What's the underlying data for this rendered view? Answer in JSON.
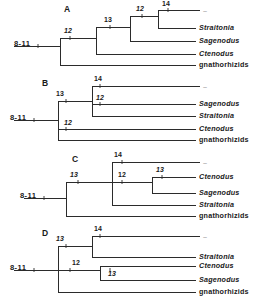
{
  "figure": {
    "background": "#ffffff",
    "line_color": "#2b2b2b"
  },
  "taxa": {
    "t1": "–",
    "straitonia": "Straitonia",
    "sagenodus": "Sagenodus",
    "ctenodus": "Ctenodus",
    "gnathorhizids": "gnathorhizids"
  },
  "root": {
    "label": "8-11"
  },
  "panels": [
    {
      "letter": "A",
      "root_label": "8-11",
      "nodes": [
        {
          "id": "a-n1",
          "label": "12"
        },
        {
          "id": "a-n2",
          "label": "13"
        },
        {
          "id": "a-n3",
          "label": "12"
        },
        {
          "id": "a-n4",
          "label": "14"
        }
      ],
      "tips": [
        {
          "id": "a-t1",
          "label": "–",
          "style": "faded"
        },
        {
          "id": "a-t2",
          "label": "Straitonia",
          "style": "italic"
        },
        {
          "id": "a-t3",
          "label": "Sagenodus",
          "style": "italic"
        },
        {
          "id": "a-t4",
          "label": "Ctenodus",
          "style": "italic"
        },
        {
          "id": "a-t5",
          "label": "gnathorhizids",
          "style": "upright"
        }
      ]
    },
    {
      "letter": "B",
      "root_label": "8-11",
      "nodes": [
        {
          "id": "b-n1",
          "label": "13"
        },
        {
          "id": "b-n2",
          "label": "14"
        },
        {
          "id": "b-n3",
          "label": "12"
        },
        {
          "id": "b-n4",
          "label": "12"
        }
      ],
      "tips": [
        {
          "id": "b-t1",
          "label": "–",
          "style": "faded"
        },
        {
          "id": "b-t2",
          "label": "Sagenodus",
          "style": "italic"
        },
        {
          "id": "b-t3",
          "label": "Straitonia",
          "style": "italic"
        },
        {
          "id": "b-t4",
          "label": "Ctenodus",
          "style": "italic"
        },
        {
          "id": "b-t5",
          "label": "gnathorhizids",
          "style": "upright"
        }
      ]
    },
    {
      "letter": "C",
      "root_label": "8-11",
      "nodes": [
        {
          "id": "c-n1",
          "label": "13"
        },
        {
          "id": "c-n2",
          "label": "14"
        },
        {
          "id": "c-n3",
          "label": "12"
        },
        {
          "id": "c-n4",
          "label": "13"
        }
      ],
      "tips": [
        {
          "id": "c-t1",
          "label": "–",
          "style": "faded"
        },
        {
          "id": "c-t2",
          "label": "Ctenodus",
          "style": "italic"
        },
        {
          "id": "c-t3",
          "label": "Sagenodus",
          "style": "italic"
        },
        {
          "id": "c-t4",
          "label": "Straitonia",
          "style": "italic"
        },
        {
          "id": "c-t5",
          "label": "gnathorhizids",
          "style": "upright"
        }
      ]
    },
    {
      "letter": "D",
      "root_label": "8-11",
      "nodes": [
        {
          "id": "d-n1",
          "label": "13"
        },
        {
          "id": "d-n2",
          "label": "14"
        },
        {
          "id": "d-n3",
          "label": "12"
        },
        {
          "id": "d-n4",
          "label": "13"
        }
      ],
      "tips": [
        {
          "id": "d-t1",
          "label": "–",
          "style": "faded"
        },
        {
          "id": "d-t2",
          "label": "Straitonia",
          "style": "italic"
        },
        {
          "id": "d-t3",
          "label": "Ctenodus",
          "style": "italic"
        },
        {
          "id": "d-t4",
          "label": "Sagenodus",
          "style": "italic"
        },
        {
          "id": "d-t5",
          "label": "gnathorhizids",
          "style": "upright"
        }
      ]
    }
  ]
}
